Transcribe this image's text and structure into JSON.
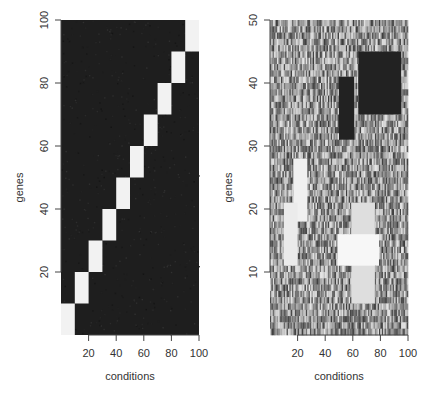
{
  "chart_data": [
    {
      "type": "heatmap",
      "panel": "left",
      "title": "",
      "xlabel": "conditions",
      "ylabel": "genes",
      "xlim": [
        0,
        100
      ],
      "ylim": [
        0,
        100
      ],
      "x_ticks": [
        20,
        40,
        60,
        80,
        100
      ],
      "y_ticks": [
        20,
        40,
        60,
        80,
        100
      ],
      "n_rows": 100,
      "n_cols": 100,
      "grid": false,
      "background_color": "#1e1e1e",
      "description": "Dark noisy background with 10 bright diagonal biclusters (10 conditions x 10 genes each)",
      "blocks": [
        {
          "x0": 0,
          "x1": 10,
          "y0": 0,
          "y1": 10,
          "color": "#f2f2f2"
        },
        {
          "x0": 10,
          "x1": 20,
          "y0": 10,
          "y1": 20,
          "color": "#f2f2f2"
        },
        {
          "x0": 20,
          "x1": 30,
          "y0": 20,
          "y1": 30,
          "color": "#f2f2f2"
        },
        {
          "x0": 30,
          "x1": 40,
          "y0": 30,
          "y1": 40,
          "color": "#f2f2f2"
        },
        {
          "x0": 40,
          "x1": 50,
          "y0": 40,
          "y1": 50,
          "color": "#f2f2f2"
        },
        {
          "x0": 50,
          "x1": 60,
          "y0": 50,
          "y1": 60,
          "color": "#f2f2f2"
        },
        {
          "x0": 60,
          "x1": 70,
          "y0": 60,
          "y1": 70,
          "color": "#f2f2f2"
        },
        {
          "x0": 70,
          "x1": 80,
          "y0": 70,
          "y1": 80,
          "color": "#f2f2f2"
        },
        {
          "x0": 80,
          "x1": 90,
          "y0": 80,
          "y1": 90,
          "color": "#f2f2f2"
        },
        {
          "x0": 90,
          "x1": 100,
          "y0": 90,
          "y1": 100,
          "color": "#f2f2f2"
        }
      ]
    },
    {
      "type": "heatmap",
      "panel": "right",
      "title": "",
      "xlabel": "conditions",
      "ylabel": "genes",
      "xlim": [
        0,
        100
      ],
      "ylim": [
        0,
        50
      ],
      "x_ticks": [
        20,
        40,
        60,
        80,
        100
      ],
      "y_ticks": [
        10,
        20,
        30,
        40,
        50
      ],
      "n_rows": 50,
      "n_cols": 100,
      "grid": false,
      "background": "random grayscale noise",
      "description": "Noisy grayscale matrix with embedded overlapping biclusters (dark = low, light = high)",
      "blocks": [
        {
          "x0": 64,
          "x1": 95,
          "y0": 35,
          "y1": 45,
          "color": "#222222"
        },
        {
          "x0": 50,
          "x1": 61,
          "y0": 31,
          "y1": 41,
          "color": "#222222"
        },
        {
          "x0": 17,
          "x1": 27,
          "y0": 18,
          "y1": 28,
          "color": "#f0f0f0"
        },
        {
          "x0": 10,
          "x1": 20,
          "y0": 11,
          "y1": 21,
          "color": "#ebebeb"
        },
        {
          "x0": 59,
          "x1": 76,
          "y0": 5,
          "y1": 21,
          "color": "#dedede"
        },
        {
          "x0": 49,
          "x1": 79,
          "y0": 11,
          "y1": 16,
          "color": "#f7f7f7"
        }
      ]
    }
  ]
}
